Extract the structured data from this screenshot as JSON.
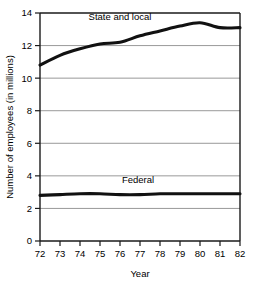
{
  "chart_data": {
    "type": "line",
    "title": "",
    "xlabel": "Year",
    "ylabel": "Number of employees (in millions)",
    "xlim": [
      72,
      82
    ],
    "ylim": [
      0,
      14
    ],
    "grid": true,
    "legend_position": "inline-annotations",
    "x": [
      72,
      73,
      74,
      75,
      76,
      77,
      78,
      79,
      80,
      81,
      82
    ],
    "xtick_labels": [
      "72",
      "73",
      "74",
      "75",
      "76",
      "77",
      "78",
      "79",
      "80",
      "81",
      "82"
    ],
    "ytick_labels": [
      "0",
      "2",
      "4",
      "6",
      "8",
      "10",
      "12",
      "14"
    ],
    "yticks": [
      0,
      2,
      4,
      6,
      8,
      10,
      12,
      14
    ],
    "series": [
      {
        "name": "State and local",
        "label": "State and local",
        "color": "#111111",
        "values": [
          10.8,
          11.4,
          11.8,
          12.1,
          12.2,
          12.6,
          12.9,
          13.2,
          13.4,
          13.1,
          13.1
        ]
      },
      {
        "name": "Federal",
        "label": "Federal",
        "color": "#111111",
        "values": [
          2.8,
          2.85,
          2.9,
          2.9,
          2.85,
          2.85,
          2.9,
          2.9,
          2.9,
          2.9,
          2.9
        ]
      }
    ],
    "annotations": [
      {
        "text": "State and local",
        "x": 76.0,
        "y": 13.55
      },
      {
        "text": "Federal",
        "x": 76.9,
        "y": 3.55
      }
    ]
  }
}
